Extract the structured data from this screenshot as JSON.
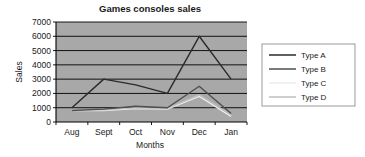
{
  "chart_data": {
    "type": "line",
    "title": "Games consoles sales",
    "xlabel": "Months",
    "ylabel": "Sales",
    "categories": [
      "Aug",
      "Sept",
      "Oct",
      "Nov",
      "Dec",
      "Jan"
    ],
    "ylim": [
      0,
      7000
    ],
    "ytick_step": 1000,
    "yticks": [
      "7000",
      "6000",
      "5000",
      "4000",
      "3000",
      "2000",
      "1000",
      "0"
    ],
    "grid": true,
    "legend_position": "right",
    "plot_background": "#a8a8a8",
    "series": [
      {
        "name": "Type A",
        "color": "#2b2b2b",
        "values": [
          1000,
          3000,
          2600,
          2000,
          6000,
          3000
        ]
      },
      {
        "name": "Type B",
        "color": "#4f4f4f",
        "values": [
          800,
          900,
          1100,
          1000,
          2500,
          600
        ]
      },
      {
        "name": "Type C",
        "color": "#ececec",
        "values": [
          800,
          800,
          950,
          900,
          1800,
          400
        ]
      },
      {
        "name": "Type D",
        "color": "#bfbfbf",
        "values": [
          850,
          850,
          1000,
          950,
          1900,
          500
        ]
      }
    ]
  }
}
